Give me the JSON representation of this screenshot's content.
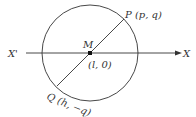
{
  "diagram": {
    "type": "geometry",
    "colors": {
      "stroke": "#333333",
      "background": "#ffffff"
    },
    "axis": {
      "left_label": "X'",
      "right_label": "X"
    },
    "center": {
      "name": "M",
      "coords": "(l, 0)"
    },
    "points": [
      {
        "name": "P",
        "coords": "(p, q)",
        "label": "P (p, q)"
      },
      {
        "name": "Q",
        "coords": "(h, −q)",
        "label": "Q (h, −q)"
      }
    ],
    "labels": {
      "x_prime": "X'",
      "x": "X",
      "m": "M",
      "m_coords": "(l, 0)",
      "p": "P (p, q)",
      "q": "Q (h, −q)"
    }
  }
}
